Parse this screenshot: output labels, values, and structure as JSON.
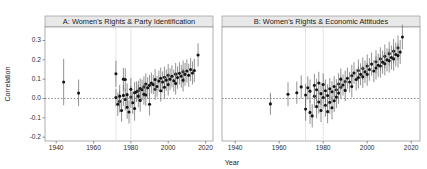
{
  "figure": {
    "width": 427,
    "height": 169,
    "background": "#ffffff",
    "xlabel": "Year",
    "ylabel": "Correlation"
  },
  "axis": {
    "y_ticks": [
      "0.3",
      "0.2",
      "0.1",
      "0.0",
      "-0.1",
      "-0.2"
    ],
    "y_tick_values": [
      0.3,
      0.2,
      0.1,
      0.0,
      -0.1,
      -0.2
    ],
    "x_ticks": [
      "1940",
      "1960",
      "1980",
      "2000",
      "2020"
    ],
    "x_tick_values": [
      1940,
      1960,
      1980,
      2000,
      2020
    ],
    "ylim": [
      -0.22,
      0.37
    ],
    "xlim": [
      1934,
      2024
    ],
    "zero_reference": 0.0
  },
  "panels": [
    {
      "id": "A",
      "title": "A: Women's Rights & Party Identification"
    },
    {
      "id": "B",
      "title": "B: Women's Rights & Economic Attitudes"
    }
  ],
  "chart_data": {
    "type": "scatter",
    "title": "",
    "subtitle": "",
    "xlabel": "Year",
    "ylabel": "Correlation",
    "xlim": [
      1934,
      2024
    ],
    "ylim": [
      -0.22,
      0.37
    ],
    "grid": "vertical-light",
    "legend": "none",
    "marker": "point-with-vertical-error-bars",
    "error_bar_type": "confidence-interval",
    "reference_line": {
      "y": 0.0,
      "style": "dashed"
    },
    "vertical_guides": [
      1972,
      1980
    ],
    "panels": [
      {
        "name": "A: Women's Rights & Party Identification",
        "x": "year",
        "y": "correlation",
        "points": [
          {
            "year": 1944,
            "value": 0.085,
            "low": -0.035,
            "high": 0.205
          },
          {
            "year": 1952,
            "value": 0.028,
            "low": -0.04,
            "high": 0.098
          },
          {
            "year": 1972,
            "value": 0.005,
            "low": -0.04,
            "high": 0.05
          },
          {
            "year": 1972,
            "value": 0.128,
            "low": 0.06,
            "high": 0.196
          },
          {
            "year": 1973,
            "value": -0.03,
            "low": -0.09,
            "high": 0.03
          },
          {
            "year": 1974,
            "value": -0.015,
            "low": -0.072,
            "high": 0.042
          },
          {
            "year": 1974,
            "value": 0.012,
            "low": -0.045,
            "high": 0.07
          },
          {
            "year": 1975,
            "value": -0.062,
            "low": -0.12,
            "high": -0.004
          },
          {
            "year": 1976,
            "value": 0.016,
            "low": -0.038,
            "high": 0.07
          },
          {
            "year": 1976,
            "value": 0.1,
            "low": 0.042,
            "high": 0.158
          },
          {
            "year": 1977,
            "value": -0.005,
            "low": -0.062,
            "high": 0.052
          },
          {
            "year": 1977,
            "value": 0.098,
            "low": 0.04,
            "high": 0.156
          },
          {
            "year": 1978,
            "value": -0.045,
            "low": -0.105,
            "high": 0.015
          },
          {
            "year": 1978,
            "value": 0.02,
            "low": -0.038,
            "high": 0.078
          },
          {
            "year": 1979,
            "value": -0.07,
            "low": -0.13,
            "high": -0.01
          },
          {
            "year": 1980,
            "value": 0.008,
            "low": -0.048,
            "high": 0.064
          },
          {
            "year": 1980,
            "value": 0.048,
            "low": -0.01,
            "high": 0.106
          },
          {
            "year": 1981,
            "value": -0.022,
            "low": -0.08,
            "high": 0.036
          },
          {
            "year": 1982,
            "value": 0.03,
            "low": -0.025,
            "high": 0.085
          },
          {
            "year": 1982,
            "value": -0.052,
            "low": -0.115,
            "high": 0.011
          },
          {
            "year": 1983,
            "value": 0.035,
            "low": -0.018,
            "high": 0.088
          },
          {
            "year": 1984,
            "value": 0.04,
            "low": -0.012,
            "high": 0.092
          },
          {
            "year": 1984,
            "value": 0.012,
            "low": -0.045,
            "high": 0.069
          },
          {
            "year": 1985,
            "value": 0.052,
            "low": 0.0,
            "high": 0.104
          },
          {
            "year": 1985,
            "value": -0.01,
            "low": -0.068,
            "high": 0.048
          },
          {
            "year": 1986,
            "value": 0.045,
            "low": -0.008,
            "high": 0.098
          },
          {
            "year": 1987,
            "value": 0.06,
            "low": 0.006,
            "high": 0.114
          },
          {
            "year": 1987,
            "value": 0.022,
            "low": -0.032,
            "high": 0.076
          },
          {
            "year": 1988,
            "value": 0.075,
            "low": 0.02,
            "high": 0.13
          },
          {
            "year": 1988,
            "value": 0.018,
            "low": -0.038,
            "high": 0.074
          },
          {
            "year": 1989,
            "value": 0.055,
            "low": 0.0,
            "high": 0.11
          },
          {
            "year": 1990,
            "value": 0.068,
            "low": 0.014,
            "high": 0.122
          },
          {
            "year": 1990,
            "value": -0.03,
            "low": -0.088,
            "high": 0.028
          },
          {
            "year": 1991,
            "value": 0.08,
            "low": 0.026,
            "high": 0.134
          },
          {
            "year": 1992,
            "value": 0.072,
            "low": 0.022,
            "high": 0.122
          },
          {
            "year": 1993,
            "value": 0.048,
            "low": -0.006,
            "high": 0.102
          },
          {
            "year": 1993,
            "value": 0.098,
            "low": 0.044,
            "high": 0.152
          },
          {
            "year": 1994,
            "value": 0.062,
            "low": 0.008,
            "high": 0.116
          },
          {
            "year": 1995,
            "value": 0.09,
            "low": 0.036,
            "high": 0.144
          },
          {
            "year": 1996,
            "value": 0.105,
            "low": 0.05,
            "high": 0.16
          },
          {
            "year": 1996,
            "value": 0.04,
            "low": -0.016,
            "high": 0.096
          },
          {
            "year": 1997,
            "value": 0.085,
            "low": 0.03,
            "high": 0.14
          },
          {
            "year": 1998,
            "value": 0.11,
            "low": 0.055,
            "high": 0.165
          },
          {
            "year": 1998,
            "value": 0.058,
            "low": 0.002,
            "high": 0.114
          },
          {
            "year": 1999,
            "value": 0.095,
            "low": 0.04,
            "high": 0.15
          },
          {
            "year": 2000,
            "value": 0.12,
            "low": 0.062,
            "high": 0.178
          },
          {
            "year": 2000,
            "value": 0.072,
            "low": 0.015,
            "high": 0.129
          },
          {
            "year": 2001,
            "value": 0.1,
            "low": 0.044,
            "high": 0.156
          },
          {
            "year": 2002,
            "value": 0.115,
            "low": 0.058,
            "high": 0.172
          },
          {
            "year": 2003,
            "value": 0.092,
            "low": 0.035,
            "high": 0.149
          },
          {
            "year": 2004,
            "value": 0.126,
            "low": 0.068,
            "high": 0.184
          },
          {
            "year": 2004,
            "value": 0.078,
            "low": 0.02,
            "high": 0.136
          },
          {
            "year": 2005,
            "value": 0.108,
            "low": 0.05,
            "high": 0.166
          },
          {
            "year": 2006,
            "value": 0.13,
            "low": 0.072,
            "high": 0.188
          },
          {
            "year": 2007,
            "value": 0.115,
            "low": 0.056,
            "high": 0.174
          },
          {
            "year": 2008,
            "value": 0.138,
            "low": 0.08,
            "high": 0.196
          },
          {
            "year": 2008,
            "value": 0.095,
            "low": 0.036,
            "high": 0.154
          },
          {
            "year": 2009,
            "value": 0.125,
            "low": 0.066,
            "high": 0.184
          },
          {
            "year": 2010,
            "value": 0.142,
            "low": 0.082,
            "high": 0.202
          },
          {
            "year": 2011,
            "value": 0.12,
            "low": 0.06,
            "high": 0.18
          },
          {
            "year": 2012,
            "value": 0.15,
            "low": 0.09,
            "high": 0.21
          },
          {
            "year": 2013,
            "value": 0.132,
            "low": 0.072,
            "high": 0.192
          },
          {
            "year": 2014,
            "value": 0.145,
            "low": 0.084,
            "high": 0.206
          },
          {
            "year": 2016,
            "value": 0.225,
            "low": 0.165,
            "high": 0.285
          }
        ]
      },
      {
        "name": "B: Women's Rights & Economic Attitudes",
        "x": "year",
        "y": "correlation",
        "points": [
          {
            "year": 1956,
            "value": -0.028,
            "low": -0.085,
            "high": 0.029
          },
          {
            "year": 1964,
            "value": 0.022,
            "low": -0.04,
            "high": 0.084
          },
          {
            "year": 1968,
            "value": 0.03,
            "low": -0.028,
            "high": 0.088
          },
          {
            "year": 1970,
            "value": 0.06,
            "low": 0.0,
            "high": 0.12
          },
          {
            "year": 1972,
            "value": 0.018,
            "low": -0.04,
            "high": 0.076
          },
          {
            "year": 1972,
            "value": -0.055,
            "low": -0.115,
            "high": 0.005
          },
          {
            "year": 1973,
            "value": 0.055,
            "low": -0.005,
            "high": 0.115
          },
          {
            "year": 1974,
            "value": -0.072,
            "low": -0.132,
            "high": -0.012
          },
          {
            "year": 1974,
            "value": 0.038,
            "low": -0.022,
            "high": 0.098
          },
          {
            "year": 1975,
            "value": -0.09,
            "low": -0.15,
            "high": -0.03
          },
          {
            "year": 1976,
            "value": 0.012,
            "low": -0.048,
            "high": 0.072
          },
          {
            "year": 1976,
            "value": 0.068,
            "low": 0.008,
            "high": 0.128
          },
          {
            "year": 1977,
            "value": -0.042,
            "low": -0.102,
            "high": 0.018
          },
          {
            "year": 1977,
            "value": 0.045,
            "low": -0.012,
            "high": 0.102
          },
          {
            "year": 1978,
            "value": -0.018,
            "low": -0.078,
            "high": 0.042
          },
          {
            "year": 1978,
            "value": 0.08,
            "low": 0.022,
            "high": 0.138
          },
          {
            "year": 1979,
            "value": -0.062,
            "low": -0.122,
            "high": -0.002
          },
          {
            "year": 1979,
            "value": 0.025,
            "low": -0.033,
            "high": 0.083
          },
          {
            "year": 1980,
            "value": 0.005,
            "low": -0.053,
            "high": 0.063
          },
          {
            "year": 1980,
            "value": 0.072,
            "low": 0.014,
            "high": 0.13
          },
          {
            "year": 1981,
            "value": -0.035,
            "low": -0.095,
            "high": 0.025
          },
          {
            "year": 1981,
            "value": 0.04,
            "low": -0.018,
            "high": 0.098
          },
          {
            "year": 1982,
            "value": 0.015,
            "low": -0.043,
            "high": 0.073
          },
          {
            "year": 1982,
            "value": -0.068,
            "low": -0.128,
            "high": -0.008
          },
          {
            "year": 1983,
            "value": 0.05,
            "low": -0.006,
            "high": 0.106
          },
          {
            "year": 1983,
            "value": -0.02,
            "low": -0.08,
            "high": 0.04
          },
          {
            "year": 1984,
            "value": 0.035,
            "low": -0.02,
            "high": 0.09
          },
          {
            "year": 1984,
            "value": -0.048,
            "low": -0.108,
            "high": 0.012
          },
          {
            "year": 1985,
            "value": 0.062,
            "low": 0.008,
            "high": 0.116
          },
          {
            "year": 1985,
            "value": -0.012,
            "low": -0.07,
            "high": 0.046
          },
          {
            "year": 1986,
            "value": 0.045,
            "low": -0.01,
            "high": 0.1
          },
          {
            "year": 1986,
            "value": 0.008,
            "low": -0.05,
            "high": 0.066
          },
          {
            "year": 1987,
            "value": 0.075,
            "low": 0.02,
            "high": 0.13
          },
          {
            "year": 1987,
            "value": 0.028,
            "low": -0.028,
            "high": 0.084
          },
          {
            "year": 1988,
            "value": 0.058,
            "low": 0.002,
            "high": 0.114
          },
          {
            "year": 1988,
            "value": 0.1,
            "low": 0.045,
            "high": 0.155
          },
          {
            "year": 1989,
            "value": 0.07,
            "low": 0.015,
            "high": 0.125
          },
          {
            "year": 1990,
            "value": 0.088,
            "low": 0.032,
            "high": 0.144
          },
          {
            "year": 1990,
            "value": 0.042,
            "low": -0.014,
            "high": 0.098
          },
          {
            "year": 1991,
            "value": 0.105,
            "low": 0.05,
            "high": 0.16
          },
          {
            "year": 1992,
            "value": 0.085,
            "low": 0.032,
            "high": 0.138
          },
          {
            "year": 1993,
            "value": 0.118,
            "low": 0.062,
            "high": 0.174
          },
          {
            "year": 1993,
            "value": 0.062,
            "low": 0.006,
            "high": 0.118
          },
          {
            "year": 1994,
            "value": 0.132,
            "low": 0.076,
            "high": 0.188
          },
          {
            "year": 1995,
            "value": 0.098,
            "low": 0.042,
            "high": 0.154
          },
          {
            "year": 1996,
            "value": 0.145,
            "low": 0.088,
            "high": 0.202
          },
          {
            "year": 1996,
            "value": 0.108,
            "low": 0.052,
            "high": 0.164
          },
          {
            "year": 1997,
            "value": 0.125,
            "low": 0.068,
            "high": 0.182
          },
          {
            "year": 1998,
            "value": 0.155,
            "low": 0.098,
            "high": 0.212
          },
          {
            "year": 1998,
            "value": 0.112,
            "low": 0.055,
            "high": 0.169
          },
          {
            "year": 1999,
            "value": 0.138,
            "low": 0.08,
            "high": 0.196
          },
          {
            "year": 2000,
            "value": 0.168,
            "low": 0.108,
            "high": 0.228
          },
          {
            "year": 2000,
            "value": 0.125,
            "low": 0.066,
            "high": 0.184
          },
          {
            "year": 2001,
            "value": 0.15,
            "low": 0.092,
            "high": 0.208
          },
          {
            "year": 2002,
            "value": 0.178,
            "low": 0.118,
            "high": 0.238
          },
          {
            "year": 2003,
            "value": 0.142,
            "low": 0.084,
            "high": 0.2
          },
          {
            "year": 2004,
            "value": 0.19,
            "low": 0.13,
            "high": 0.25
          },
          {
            "year": 2004,
            "value": 0.158,
            "low": 0.098,
            "high": 0.218
          },
          {
            "year": 2005,
            "value": 0.172,
            "low": 0.112,
            "high": 0.232
          },
          {
            "year": 2006,
            "value": 0.205,
            "low": 0.145,
            "high": 0.265
          },
          {
            "year": 2006,
            "value": 0.168,
            "low": 0.108,
            "high": 0.228
          },
          {
            "year": 2007,
            "value": 0.188,
            "low": 0.128,
            "high": 0.248
          },
          {
            "year": 2008,
            "value": 0.218,
            "low": 0.156,
            "high": 0.28
          },
          {
            "year": 2008,
            "value": 0.18,
            "low": 0.12,
            "high": 0.24
          },
          {
            "year": 2009,
            "value": 0.2,
            "low": 0.14,
            "high": 0.26
          },
          {
            "year": 2010,
            "value": 0.232,
            "low": 0.17,
            "high": 0.294
          },
          {
            "year": 2010,
            "value": 0.195,
            "low": 0.134,
            "high": 0.256
          },
          {
            "year": 2011,
            "value": 0.212,
            "low": 0.15,
            "high": 0.274
          },
          {
            "year": 2012,
            "value": 0.245,
            "low": 0.182,
            "high": 0.308
          },
          {
            "year": 2012,
            "value": 0.205,
            "low": 0.144,
            "high": 0.266
          },
          {
            "year": 2013,
            "value": 0.228,
            "low": 0.166,
            "high": 0.29
          },
          {
            "year": 2014,
            "value": 0.262,
            "low": 0.198,
            "high": 0.326
          },
          {
            "year": 2014,
            "value": 0.222,
            "low": 0.16,
            "high": 0.284
          },
          {
            "year": 2015,
            "value": 0.24,
            "low": 0.178,
            "high": 0.302
          },
          {
            "year": 2016,
            "value": 0.318,
            "low": 0.254,
            "high": 0.382
          }
        ]
      }
    ]
  }
}
